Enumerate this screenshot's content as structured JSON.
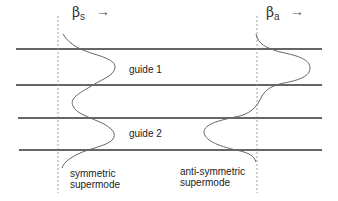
{
  "diagram": {
    "guides": [
      {
        "label": "guide 1"
      },
      {
        "label": "guide 2"
      }
    ],
    "modes": [
      {
        "name": "symmetric",
        "beta_symbol": "β",
        "beta_sub": "s",
        "arrow": "→",
        "caption_line1": "symmetric",
        "caption_line2": "supermode"
      },
      {
        "name": "anti-symmetric",
        "beta_symbol": "β",
        "beta_sub": "a",
        "arrow": "→",
        "caption_line1": "anti-symmetric",
        "caption_line2": "supermode"
      }
    ],
    "colors": {
      "guide_lines": "#333333",
      "mode_curves": "#666666",
      "axis_dotted": "#888888"
    }
  }
}
